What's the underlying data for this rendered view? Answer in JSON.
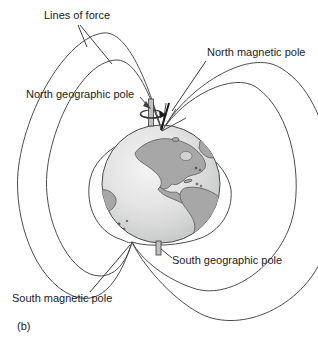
{
  "diagram": {
    "title_hint": "Earth's magnetic field lines of force with geographic and magnetic poles",
    "labels": {
      "lines_of_force": "Lines of force",
      "north_magnetic_pole": "North magnetic pole",
      "north_geographic_pole": "North geographic pole",
      "south_geographic_pole": "South geographic pole",
      "south_magnetic_pole": "South magnetic pole",
      "figure_label": "(b)"
    },
    "colors": {
      "background": "#ffffff",
      "field_line": "#4d4d4d",
      "leader_line": "#3d3d3d",
      "globe_outline": "#4a4a4a",
      "ocean_highlight": "#f4f4f4",
      "ocean_edge": "#bfc1c0",
      "land": "#a7a7a7",
      "land_outline": "#4f4f4f",
      "inland_water": "#d2d2d2",
      "axis_rod": "#c0c0c0",
      "axis_rod_outline": "#3a3a3a",
      "needle": "#1a1a1a",
      "text": "#222222"
    }
  }
}
